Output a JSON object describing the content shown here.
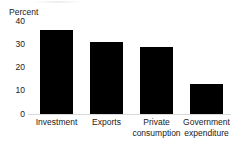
{
  "chart_data": {
    "type": "bar",
    "title": "",
    "subtitle": "",
    "xlabel": "",
    "ylabel": "Percent",
    "ylim": [
      0,
      40
    ],
    "ytick_labels": [
      "40",
      "30",
      "20",
      "10",
      "0"
    ],
    "ytick_values": [
      40,
      30,
      20,
      10,
      0
    ],
    "grid": false,
    "legend": false,
    "legend_position": "none",
    "bar_color": "#000000",
    "baseline_color": "#d9d9d9",
    "text_color": "#1a1a1a",
    "background_color": "#ffffff",
    "categories": [
      "Investment",
      "Exports",
      "Private\nconsumption",
      "Government\nexpenditure"
    ],
    "values": [
      36,
      31,
      29,
      13
    ]
  }
}
